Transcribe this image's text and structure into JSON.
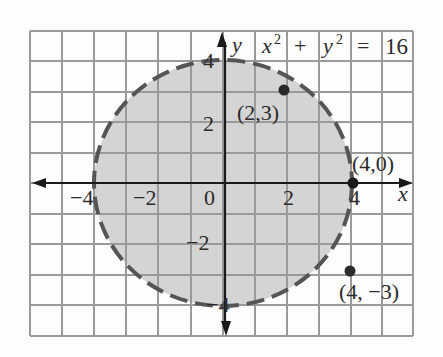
{
  "figure": {
    "equation": {
      "x_var": "x",
      "sup": "2",
      "plus": "+",
      "y_var": "y",
      "equals": "=",
      "rhs": "16"
    },
    "axes": {
      "x_label": "x",
      "y_label": "y",
      "x_ticks": [
        "−4",
        "−2",
        "0",
        "2",
        "4"
      ],
      "y_ticks": [
        "4",
        "2",
        "−2",
        "−4"
      ]
    },
    "points": [
      {
        "label": "(2,3)",
        "x": 2,
        "y": 3
      },
      {
        "label": "(4,0)",
        "x": 4,
        "y": 0
      },
      {
        "label": "(4, −3)",
        "x": 4,
        "y": -3
      }
    ],
    "circle": {
      "center": [
        0,
        0
      ],
      "radius": 4,
      "style": "dashed",
      "fill": "shaded interior"
    },
    "colors": {
      "grid": "#9a9a9a",
      "fill": "#d4d4d4",
      "curve": "#555555",
      "axis": "#1a1a1a",
      "point": "#2a2a2a"
    }
  }
}
